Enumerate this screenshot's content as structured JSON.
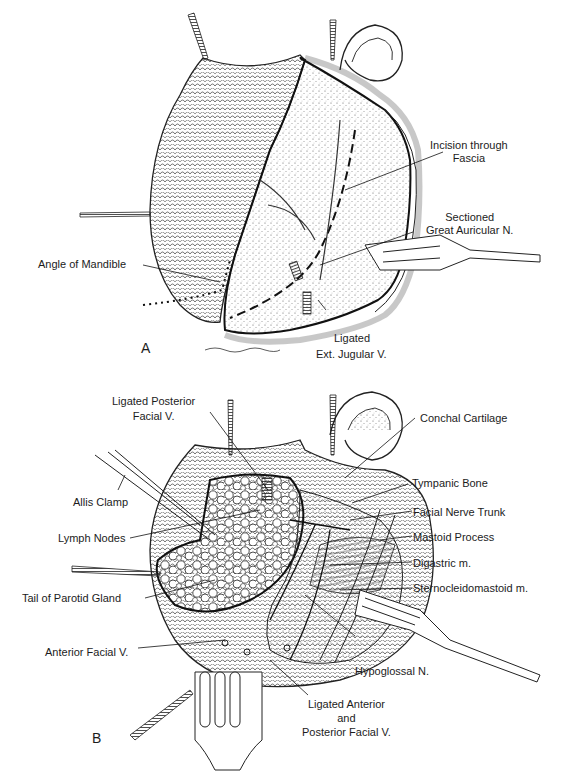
{
  "figure": {
    "panels": [
      {
        "id": "A",
        "letter": "A",
        "labels": {
          "incision": [
            "Incision through",
            "Fascia"
          ],
          "auricular": [
            "Sectioned",
            "Great Auricular N."
          ],
          "mandible": "Angle of Mandible",
          "jugular": [
            "Ligated",
            "Ext. Jugular V."
          ]
        }
      },
      {
        "id": "B",
        "letter": "B",
        "labels": {
          "post_facial": [
            "Ligated Posterior",
            "Facial V."
          ],
          "allis": "Allis Clamp",
          "lymph": "Lymph Nodes",
          "parotid_tail": "Tail of Parotid Gland",
          "ant_facial": "Anterior Facial V.",
          "conchal": "Conchal Cartilage",
          "tympanic": "Tympanic Bone",
          "facial_nerve": "Facial Nerve Trunk",
          "mastoid": "Mastoid Process",
          "digastric": "Digastric m.",
          "scm": "Sternocleidomastoid m.",
          "hypoglossal": "Hypoglossal N.",
          "ligated_ant_post": [
            "Ligated Anterior",
            "and",
            "Posterior Facial V."
          ]
        }
      }
    ],
    "colors": {
      "ink": "#1c1c1c",
      "background": "#ffffff",
      "stipple": "#555555"
    }
  }
}
